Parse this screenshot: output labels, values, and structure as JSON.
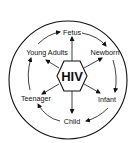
{
  "diagram": {
    "center": {
      "label": "HIV",
      "shape": "hexagon"
    },
    "nodes": [
      {
        "id": "fetus",
        "label": "Fetus"
      },
      {
        "id": "newborn",
        "label": "Newborn"
      },
      {
        "id": "infant",
        "label": "Infant"
      },
      {
        "id": "child",
        "label": "Child"
      },
      {
        "id": "teenager",
        "label": "Teenager"
      },
      {
        "id": "young-adults",
        "label": "Young Adults"
      }
    ],
    "cycle_direction": "clockwise",
    "colors": {
      "stroke": "#111111",
      "background": "#ffffff"
    }
  }
}
